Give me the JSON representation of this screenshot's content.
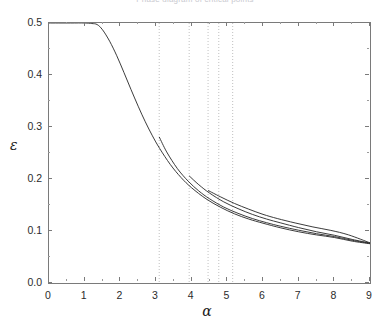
{
  "figure": {
    "title_clipped": "Phase diagram of critical points",
    "background": "#ffffff",
    "frame_color": "#7a7a7a",
    "curve_color": "#262626",
    "marker_line_color": "#b0b0b0"
  },
  "axes": {
    "x": {
      "label": "α",
      "min": 0,
      "max": 9,
      "ticks": [
        0,
        1,
        2,
        3,
        4,
        5,
        6,
        7,
        8,
        9
      ],
      "tick_labels": [
        "0",
        "1",
        "2",
        "3",
        "4",
        "5",
        "6",
        "7",
        "8",
        "9"
      ],
      "minor_per_interval": 1
    },
    "y": {
      "label": "ε",
      "min": 0.0,
      "max": 0.5,
      "ticks": [
        0.0,
        0.1,
        0.2,
        0.3,
        0.4,
        0.5
      ],
      "tick_labels": [
        "0.0",
        "0.1",
        "0.2",
        "0.3",
        "0.4",
        "0.5"
      ],
      "minor_per_interval": 1
    }
  },
  "chart_data": {
    "type": "line",
    "title": "",
    "xlabel": "α",
    "ylabel": "ε",
    "xlim": [
      0,
      9
    ],
    "ylim": [
      0.0,
      0.5
    ],
    "grid": false,
    "legend": "none",
    "series": [
      {
        "name": "curve-1",
        "comment": "upper branch: flat at 0.5 until alpha~1.35 then monotone decay",
        "x": [
          0.0,
          0.6,
          1.0,
          1.2,
          1.35,
          1.5,
          1.7,
          1.9,
          2.1,
          2.3,
          2.5,
          2.7,
          2.9,
          3.1,
          3.4,
          3.7,
          4.0,
          4.4,
          4.8,
          5.2,
          5.6,
          6.0,
          6.5,
          7.0,
          7.5,
          8.0,
          8.5,
          9.0
        ],
        "y": [
          0.5,
          0.5,
          0.5,
          0.499,
          0.497,
          0.487,
          0.465,
          0.437,
          0.405,
          0.372,
          0.34,
          0.31,
          0.283,
          0.259,
          0.228,
          0.203,
          0.183,
          0.162,
          0.146,
          0.133,
          0.123,
          0.115,
          0.106,
          0.0985,
          0.0925,
          0.0875,
          0.0805,
          0.0755
        ]
      },
      {
        "name": "curve-2",
        "comment": "branch emerging at alpha~3.09, eps~0.281",
        "x": [
          3.09,
          3.3,
          3.6,
          3.9,
          4.2,
          4.5,
          4.9,
          5.3,
          5.7,
          6.1,
          6.5,
          7.0,
          7.5,
          8.0,
          8.5,
          9.0
        ],
        "y": [
          0.281,
          0.252,
          0.22,
          0.196,
          0.177,
          0.162,
          0.146,
          0.134,
          0.124,
          0.116,
          0.109,
          0.1015,
          0.0948,
          0.0893,
          0.0822,
          0.0762
        ]
      },
      {
        "name": "curve-3",
        "comment": "branch emerging at alpha~3.93, eps~0.206",
        "x": [
          3.93,
          4.2,
          4.5,
          4.9,
          5.3,
          5.7,
          6.1,
          6.5,
          7.0,
          7.5,
          8.0,
          8.5,
          9.0
        ],
        "y": [
          0.206,
          0.189,
          0.173,
          0.156,
          0.143,
          0.132,
          0.123,
          0.1155,
          0.1065,
          0.0985,
          0.0918,
          0.0838,
          0.0768
        ]
      },
      {
        "name": "curve-4",
        "comment": "branch emerging at alpha~4.46, eps~0.178",
        "x": [
          4.46,
          4.8,
          5.2,
          5.6,
          6.0,
          6.4,
          6.9,
          7.4,
          7.9,
          8.4,
          9.0
        ],
        "y": [
          0.178,
          0.166,
          0.153,
          0.142,
          0.132,
          0.124,
          0.1155,
          0.1078,
          0.1012,
          0.0925,
          0.0772
        ]
      }
    ],
    "marker_lines": {
      "orientation": "vertical",
      "style": "dotted",
      "x_values": [
        3.09,
        3.93,
        4.46,
        4.76,
        5.15
      ],
      "y_from": 0.5,
      "y_to": 0.0
    }
  }
}
